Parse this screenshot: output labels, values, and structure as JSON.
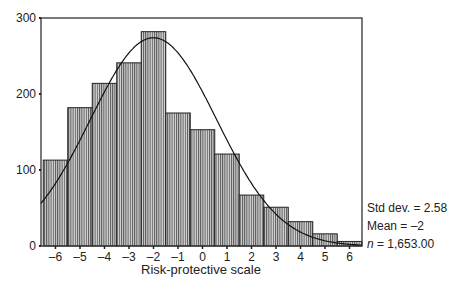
{
  "chart_data": {
    "type": "bar",
    "subtype": "histogram_with_normal_curve",
    "title": "",
    "xlabel": "Risk-protective scale",
    "ylabel": "",
    "categories": [
      -6,
      -5,
      -4,
      -3,
      -2,
      -1,
      0,
      1,
      2,
      3,
      4,
      5,
      6
    ],
    "values": [
      113,
      182,
      214,
      241,
      282,
      175,
      153,
      121,
      67,
      51,
      32,
      16,
      6
    ],
    "bin_width": 1,
    "xlim": [
      -6.6,
      6.5
    ],
    "ylim": [
      0,
      300
    ],
    "x_ticks": [
      "-6",
      "-5",
      "-4",
      "-3",
      "-2",
      "-1",
      "0",
      "1",
      "2",
      "3",
      "4",
      "5",
      "6"
    ],
    "y_ticks": [
      "0",
      "100",
      "200",
      "300"
    ],
    "grid": false,
    "normal_curve": {
      "mean": -2,
      "std_dev": 2.58,
      "n": 1653,
      "peak": 274
    },
    "annotations": {
      "std_dev": "Std dev. = 2.58",
      "mean": "Mean = –2",
      "n_label": "n",
      "n_value": " = 1,653.00"
    },
    "legend_position": "right-bottom"
  }
}
